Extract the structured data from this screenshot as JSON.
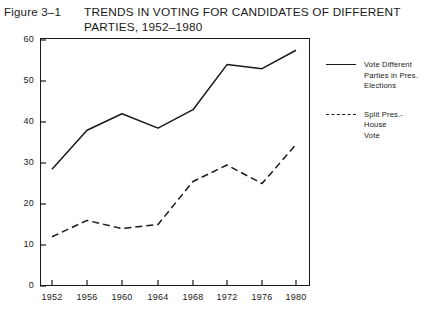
{
  "figure": {
    "label": "Figure 3–1",
    "title_line1": "TRENDS IN VOTING FOR CANDIDATES OF DIFFERENT",
    "title_line2": "PARTIES, 1952–1980"
  },
  "legend": {
    "entries": [
      {
        "label_line1": "Vote Different",
        "label_line2": "Parties in Pres.",
        "label_line3": "Elections",
        "style": "solid"
      },
      {
        "label_line1": "Split Pres.-House",
        "label_line2": "Vote",
        "label_line3": "",
        "style": "dashed"
      }
    ]
  },
  "axes": {
    "y_label": "Percent",
    "y_ticks": [
      "60",
      "50",
      "40",
      "30",
      "20",
      "10",
      "0"
    ],
    "x_ticks": [
      "1952",
      "1956",
      "1960",
      "1964",
      "1968",
      "1972",
      "1976",
      "1980"
    ]
  },
  "colors": {
    "ink": "#1a1a1a",
    "background": "#ffffff"
  },
  "chart_data": {
    "type": "line",
    "title": "TRENDS IN VOTING FOR CANDIDATES OF DIFFERENT PARTIES, 1952–1980",
    "xlabel": "",
    "ylabel": "Percent",
    "x": [
      1952,
      1956,
      1960,
      1964,
      1968,
      1972,
      1976,
      1980
    ],
    "categories": [
      "1952",
      "1956",
      "1960",
      "1964",
      "1968",
      "1972",
      "1976",
      "1980"
    ],
    "ylim": [
      0,
      60
    ],
    "xlim": [
      1950,
      1982
    ],
    "yticks": [
      0,
      10,
      20,
      30,
      40,
      50,
      60
    ],
    "grid": false,
    "legend_position": "right",
    "series": [
      {
        "name": "Vote Different Parties in Pres. Elections",
        "style": "solid",
        "values": [
          28.5,
          38,
          42,
          38.5,
          43,
          54,
          53,
          57.5
        ]
      },
      {
        "name": "Split Pres.-House Vote",
        "style": "dashed",
        "values": [
          12,
          16,
          14,
          15,
          25.5,
          29.5,
          25,
          34.5
        ]
      }
    ]
  }
}
